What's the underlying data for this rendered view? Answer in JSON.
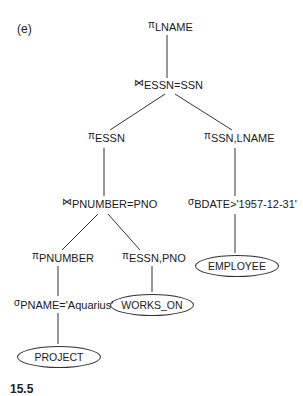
{
  "figure": {
    "label": "(e)",
    "caption_fragment": "15.5"
  },
  "tree": {
    "root": {
      "op": "π",
      "sub": "LNAME"
    },
    "join_top": {
      "op": "⋈",
      "sub": "ESSN=SSN"
    },
    "proj_essn": {
      "op": "π",
      "sub": "ESSN"
    },
    "proj_ssn_lname": {
      "op": "π",
      "sub": "SSN,LNAME"
    },
    "join_pnumber": {
      "op": "⋈",
      "sub": "PNUMBER=PNO"
    },
    "select_bdate": {
      "op": "σ",
      "sub": "BDATE>'1957-12-31'"
    },
    "proj_pnumber": {
      "op": "π",
      "sub": "PNUMBER"
    },
    "proj_essn_pno": {
      "op": "π",
      "sub": "ESSN,PNO"
    },
    "select_pname": {
      "op": "σ",
      "sub": "PNAME='Aquarius'"
    },
    "rel_employee": "EMPLOYEE",
    "rel_works_on": "WORKS_ON",
    "rel_project": "PROJECT"
  }
}
